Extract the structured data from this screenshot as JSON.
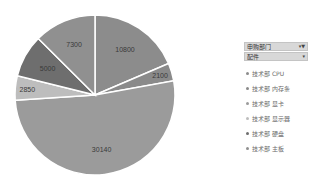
{
  "chart_data": {
    "type": "pie",
    "title": "",
    "categories": [
      "技术部 CPU",
      "技术部 内存条",
      "技术部 显卡",
      "技术部 显示器",
      "技术部 硬盘",
      "技术部 主板"
    ],
    "values": [
      10800,
      2100,
      30140,
      2850,
      5000,
      7300
    ],
    "colors": [
      "#8c8c8c",
      "#8a8a8a",
      "#9b9b9b",
      "#bdbdbd",
      "#6e6e6e",
      "#909090"
    ],
    "start_angle_deg": 0,
    "direction": "clockwise",
    "data_labels": [
      "10800",
      "2100",
      "30140",
      "2850",
      "5000",
      "7300"
    ],
    "legend_position": "right"
  },
  "filters": {
    "field_1": {
      "label": "申购部门",
      "icon": "filter-icon"
    },
    "field_2": {
      "label": "配件",
      "icon": "dropdown-icon"
    }
  },
  "legend": {
    "items": [
      {
        "label": "技术部 CPU",
        "color": "#8c8c8c"
      },
      {
        "label": "技术部 内存条",
        "color": "#8a8a8a"
      },
      {
        "label": "技术部 显卡",
        "color": "#9b9b9b"
      },
      {
        "label": "技术部 显示器",
        "color": "#bdbdbd"
      },
      {
        "label": "技术部 硬盘",
        "color": "#6e6e6e"
      },
      {
        "label": "技术部 主板",
        "color": "#909090"
      }
    ]
  }
}
